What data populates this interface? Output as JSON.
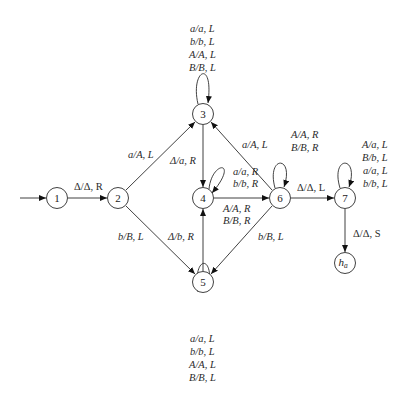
{
  "diagram": {
    "type": "turing-machine-state-diagram",
    "start_state": "1",
    "halt_state": "h_a",
    "nodes": [
      {
        "id": "1",
        "label": "1",
        "x": 57,
        "y": 198
      },
      {
        "id": "2",
        "label": "2",
        "x": 118,
        "y": 198
      },
      {
        "id": "3",
        "label": "3",
        "x": 203,
        "y": 114
      },
      {
        "id": "4",
        "label": "4",
        "x": 203,
        "y": 198
      },
      {
        "id": "5",
        "label": "5",
        "x": 203,
        "y": 282
      },
      {
        "id": "6",
        "label": "6",
        "x": 280,
        "y": 198
      },
      {
        "id": "7",
        "label": "7",
        "x": 345,
        "y": 198
      },
      {
        "id": "ha",
        "label": "h",
        "sub": "a",
        "x": 345,
        "y": 263
      }
    ],
    "edges": [
      {
        "from": "start",
        "to": "1",
        "labels": []
      },
      {
        "from": "1",
        "to": "2",
        "labels": [
          "Δ/Δ, R"
        ]
      },
      {
        "from": "2",
        "to": "3",
        "labels": [
          "a/A, L"
        ]
      },
      {
        "from": "2",
        "to": "5",
        "labels": [
          "b/B, L"
        ]
      },
      {
        "from": "3",
        "to": "3",
        "labels": [
          "a/a, L",
          "b/b, L",
          "A/A, L",
          "B/B, L"
        ]
      },
      {
        "from": "3",
        "to": "4",
        "labels": [
          "Δ/a, R"
        ]
      },
      {
        "from": "5",
        "to": "4",
        "labels": [
          "Δ/b, R"
        ]
      },
      {
        "from": "5",
        "to": "5",
        "labels": [
          "a/a, L",
          "b/b, L",
          "A/A, L",
          "B/B, L"
        ]
      },
      {
        "from": "4",
        "to": "4",
        "labels": [
          "a/a, R",
          "b/b, R"
        ]
      },
      {
        "from": "4",
        "to": "6",
        "labels": [
          "A/A, R",
          "B/B, R"
        ]
      },
      {
        "from": "6",
        "to": "3",
        "labels": [
          "a/A, L"
        ]
      },
      {
        "from": "6",
        "to": "5",
        "labels": [
          "b/B, L"
        ]
      },
      {
        "from": "6",
        "to": "6",
        "labels": [
          "A/A, R",
          "B/B, R"
        ]
      },
      {
        "from": "6",
        "to": "7",
        "labels": [
          "Δ/Δ, L"
        ]
      },
      {
        "from": "7",
        "to": "7",
        "labels": [
          "A/a, L",
          "B/b, L",
          "a/a, L",
          "b/b, L"
        ]
      },
      {
        "from": "7",
        "to": "ha",
        "labels": [
          "Δ/Δ, S"
        ]
      }
    ]
  },
  "labels": {
    "n1": "1",
    "n2": "2",
    "n3": "3",
    "n4": "4",
    "n5": "5",
    "n6": "6",
    "n7": "7",
    "ha_main": "h",
    "ha_sub": "a",
    "e12": "Δ/Δ, R",
    "e23": "a/A, L",
    "e25": "b/B, L",
    "e33": [
      "a/a, L",
      "b/b, L",
      "A/A, L",
      "B/B, L"
    ],
    "e34": "Δ/a, R",
    "e54": "Δ/b, R",
    "e55": [
      "a/a, L",
      "b/b, L",
      "A/A, L",
      "B/B, L"
    ],
    "e44": [
      "a/a, R",
      "b/b, R"
    ],
    "e46": [
      "A/A, R",
      "B/B, R"
    ],
    "e63": "a/A, L",
    "e65": "b/B, L",
    "e66": [
      "A/A, R",
      "B/B, R"
    ],
    "e67": "Δ/Δ, L",
    "e77": [
      "A/a, L",
      "B/b, L",
      "a/a, L",
      "b/b, L"
    ],
    "e7h": "Δ/Δ, S"
  }
}
